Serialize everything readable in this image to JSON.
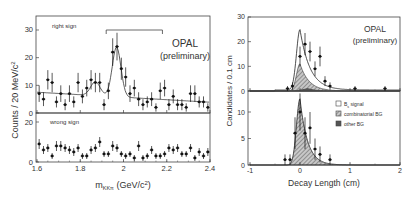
{
  "chart_data": [
    {
      "type": "scatter",
      "title": "",
      "annotation": [
        "OPAL",
        "(preliminary)"
      ],
      "xlabel": "m_KKπ (GeV/c²)",
      "xlabel_main": "m",
      "xlabel_sub": "KKπ",
      "xlabel_rest": " (GeV/c",
      "xlabel_sup": "2",
      "xlabel_end": ")",
      "ylabel": "Counts / 20 MeV/c²",
      "ylabel_main": "Counts / 20 MeV/c",
      "ylabel_sup": "2",
      "xlim": [
        1.6,
        2.4
      ],
      "xticks": [
        "1.6",
        "1.8",
        "2",
        "2.2",
        "2.4"
      ],
      "xtick_values": [
        1.6,
        1.8,
        2.0,
        2.2,
        2.4
      ],
      "grid": false,
      "signal_window": [
        1.92,
        2.18
      ],
      "panels": [
        {
          "name": "right sign",
          "label": "right sign",
          "ylim": [
            0,
            35
          ],
          "yticks": [
            "0",
            "10",
            "20",
            "30"
          ],
          "ytick_values": [
            0,
            10,
            20,
            30
          ],
          "x": [
            1.61,
            1.63,
            1.65,
            1.67,
            1.69,
            1.71,
            1.73,
            1.75,
            1.77,
            1.79,
            1.81,
            1.83,
            1.85,
            1.87,
            1.89,
            1.91,
            1.93,
            1.95,
            1.97,
            1.99,
            2.01,
            2.03,
            2.05,
            2.07,
            2.09,
            2.11,
            2.13,
            2.15,
            2.17,
            2.19,
            2.21,
            2.23,
            2.25,
            2.27,
            2.29,
            2.31,
            2.33,
            2.35,
            2.37,
            2.39
          ],
          "values": [
            7,
            5,
            12,
            11,
            4,
            7,
            3,
            7,
            4,
            11,
            6,
            9,
            12,
            11,
            11,
            3,
            8,
            22,
            24,
            16,
            13,
            7,
            9,
            5,
            3,
            4,
            5,
            2,
            8,
            9,
            3,
            6,
            3,
            3,
            2,
            7,
            7,
            4,
            4,
            2
          ],
          "errors": [
            3,
            2.5,
            3.5,
            3.5,
            2,
            3,
            2,
            3,
            2,
            3.5,
            2.5,
            3,
            3.5,
            3.5,
            3.5,
            2,
            3,
            5,
            5,
            4,
            3.5,
            3,
            3,
            2.5,
            2,
            2,
            2.5,
            1.5,
            3,
            3,
            2,
            2.5,
            2,
            2,
            1.5,
            3,
            3,
            2,
            2,
            1.5
          ],
          "fit": "linear background + Gaussian peaks at 1.87 (D±) and 1.97 (Ds)"
        },
        {
          "name": "wrong sign",
          "label": "wrong sign",
          "ylim": [
            0,
            20
          ],
          "yticks": [
            "0",
            "20"
          ],
          "ytick_values": [
            0,
            20
          ],
          "x": [
            1.61,
            1.63,
            1.65,
            1.67,
            1.69,
            1.71,
            1.73,
            1.75,
            1.77,
            1.79,
            1.81,
            1.83,
            1.85,
            1.87,
            1.89,
            1.91,
            1.93,
            1.95,
            1.97,
            1.99,
            2.01,
            2.03,
            2.05,
            2.07,
            2.09,
            2.11,
            2.13,
            2.15,
            2.17,
            2.19,
            2.21,
            2.23,
            2.25,
            2.27,
            2.29,
            2.31,
            2.33,
            2.35,
            2.37,
            2.39
          ],
          "values": [
            9,
            6,
            7,
            3,
            8,
            8,
            7,
            6,
            5,
            7,
            3,
            3,
            6,
            7,
            10,
            4,
            4,
            8,
            7,
            4,
            3,
            4,
            2,
            8,
            2,
            3,
            6,
            3,
            3,
            4,
            7,
            6,
            7,
            4,
            4,
            7,
            2,
            5,
            3,
            5
          ],
          "errors": [
            2.5,
            2,
            2,
            1.5,
            2.5,
            2.5,
            2,
            2,
            2,
            2,
            1.5,
            1.5,
            2,
            2,
            2.5,
            1.5,
            1.5,
            2.5,
            2,
            1.5,
            1.5,
            1.5,
            1.5,
            2.5,
            1.5,
            1.5,
            2,
            1.5,
            1.5,
            1.5,
            2,
            2,
            2,
            1.5,
            1.5,
            2,
            1.5,
            2,
            1.5,
            2
          ]
        }
      ]
    },
    {
      "type": "area",
      "title": "",
      "annotation": [
        "OPAL",
        "(preliminary)"
      ],
      "xlabel": "Decay Length (cm)",
      "ylabel": "Candidates / 0.1 cm",
      "xlim": [
        -1,
        2
      ],
      "xticks": [
        "-1",
        "0",
        "1",
        "2"
      ],
      "xtick_values": [
        -1,
        0,
        1,
        2
      ],
      "grid": false,
      "legend": {
        "position": "right, between panels",
        "entries": [
          {
            "label_main": "B",
            "label_sub": "s",
            "label_rest": " signal",
            "label": "Bs signal",
            "fill": "#ffffff"
          },
          {
            "label": "combinatorial BG",
            "fill": "#b8b8b8"
          },
          {
            "label": "other BG",
            "fill": "#555555"
          }
        ]
      },
      "panels": [
        {
          "name": "signal region",
          "ylim": [
            0,
            30
          ],
          "yticks": [
            "0",
            "10",
            "20",
            "30"
          ],
          "ytick_values": [
            0,
            10,
            20,
            30
          ],
          "x": [
            -0.25,
            -0.15,
            0.0,
            0.1,
            0.2,
            0.3,
            0.4,
            0.5,
            0.6,
            1.1,
            1.7
          ],
          "values": [
            1,
            2,
            14,
            19,
            16,
            9,
            14,
            4,
            2,
            1,
            1
          ],
          "errors": [
            1,
            1.5,
            4,
            4.5,
            4,
            3,
            4,
            2,
            1.5,
            1,
            1
          ],
          "total_fit_peak": 24.5,
          "combinatorial_peak": 11
        },
        {
          "name": "sideband",
          "ylim": [
            0,
            15
          ],
          "yticks": [
            "0",
            "5",
            "10"
          ],
          "ytick_values": [
            0,
            5,
            10
          ],
          "x": [
            -0.3,
            -0.2,
            -0.1,
            0.0,
            0.1,
            0.2,
            0.3,
            0.4,
            0.6
          ],
          "values": [
            1,
            1,
            6,
            10,
            6,
            7,
            3,
            2,
            1
          ],
          "errors": [
            1,
            1,
            3,
            3.5,
            3,
            3,
            2,
            1.5,
            1
          ],
          "combinatorial_peak": 12.5
        }
      ]
    }
  ]
}
